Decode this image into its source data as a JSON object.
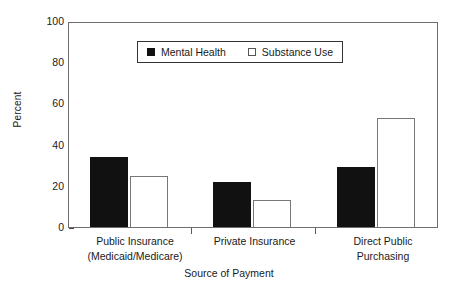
{
  "chart_data": {
    "type": "bar",
    "title": "",
    "subtitle": "",
    "xlabel": "Source of Payment",
    "ylabel": "Percent",
    "ylim": [
      0,
      100
    ],
    "yticks": [
      0,
      20,
      40,
      60,
      80,
      100
    ],
    "ytick_labels": [
      "0",
      "20",
      "40",
      "60",
      "80",
      "100"
    ],
    "grid": false,
    "legend_position": "upper center",
    "categories": [
      "Public Insurance (Medicaid/Medicare)",
      "Private Insurance",
      "Direct Public Purchasing"
    ],
    "category_lines": [
      [
        "Public Insurance",
        "(Medicaid/Medicare)"
      ],
      [
        "Private Insurance",
        ""
      ],
      [
        "Direct Public",
        "Purchasing"
      ]
    ],
    "series": [
      {
        "name": "Mental Health",
        "marker": "filled-square",
        "color": "#111111",
        "values": [
          34,
          22,
          29
        ]
      },
      {
        "name": "Substance Use",
        "marker": "open-square",
        "color": "#ffffff",
        "values": [
          25,
          13,
          53
        ]
      }
    ]
  },
  "axis": {
    "y_label": "Percent",
    "x_title": "Source of Payment",
    "ticks": [
      "100",
      "80",
      "60",
      "40",
      "20",
      "0"
    ]
  },
  "legend": {
    "items": [
      {
        "label": "Mental Health"
      },
      {
        "label": "Substance Use"
      }
    ]
  },
  "colors": {
    "series_filled": "#111111",
    "series_open": "#ffffff",
    "frame": "#6e6e6e",
    "text": "#1a1a1a",
    "background": "#ffffff"
  }
}
